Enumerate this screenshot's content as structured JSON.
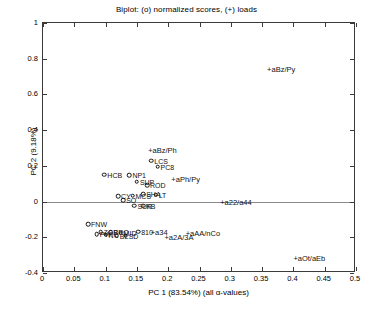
{
  "chart_data": {
    "type": "scatter",
    "title": "Biplot: (o) normalized scores, (+) loads",
    "xlabel": "PC 1 (83.54%) (all α-values)",
    "ylabel": "PC 2 (9.18%)",
    "xlim": [
      0,
      0.5
    ],
    "ylim": [
      -0.4,
      1
    ],
    "xticks": [
      "0",
      "0.05",
      "0.1",
      "0.15",
      "0.2",
      "0.25",
      "0.3",
      "0.35",
      "0.4",
      "0.45",
      "0.5"
    ],
    "xtick_values": [
      0,
      0.05,
      0.1,
      0.15,
      0.2,
      0.25,
      0.3,
      0.35,
      0.4,
      0.45,
      0.5
    ],
    "yticks": [
      "1",
      "0.8",
      "0.6",
      "0.4",
      "0.2",
      "0",
      "-0.2",
      "-0.4"
    ],
    "ytick_values": [
      1,
      0.8,
      0.6,
      0.4,
      0.2,
      0,
      -0.2,
      -0.4
    ],
    "grid": false,
    "legend": "none",
    "zero_line_y": 0,
    "series": [
      {
        "name": "normalized scores",
        "marker": "o",
        "points": [
          {
            "label": "HCB",
            "x": 0.098,
            "y": 0.15,
            "label_pos": "left"
          },
          {
            "label": "NP1",
            "x": 0.138,
            "y": 0.148,
            "label_pos": "right"
          },
          {
            "label": "LCS",
            "x": 0.173,
            "y": 0.228,
            "label_pos": "right"
          },
          {
            "label": "PC8",
            "x": 0.183,
            "y": 0.196,
            "label_pos": "right"
          },
          {
            "label": "SUP",
            "x": 0.15,
            "y": 0.112,
            "label_pos": "right"
          },
          {
            "label": "ROD",
            "x": 0.166,
            "y": 0.093,
            "label_pos": "right"
          },
          {
            "label": "CY",
            "x": 0.12,
            "y": 0.03,
            "label_pos": "right"
          },
          {
            "label": "MCS",
            "x": 0.143,
            "y": 0.034,
            "label_pos": "right"
          },
          {
            "label": "SHA",
            "x": 0.16,
            "y": 0.04,
            "label_pos": "right"
          },
          {
            "label": "LT",
            "x": 0.18,
            "y": 0.038,
            "label_pos": "right"
          },
          {
            "label": "SO",
            "x": 0.128,
            "y": 0.008,
            "label_pos": "right"
          },
          {
            "label": "KB",
            "x": 0.16,
            "y": -0.022,
            "label_pos": "right"
          },
          {
            "label": "SUR",
            "x": 0.146,
            "y": -0.022,
            "label_pos": "right"
          },
          {
            "label": "FNW",
            "x": 0.072,
            "y": -0.128,
            "label_pos": "right"
          },
          {
            "label": "ZGB",
            "x": 0.092,
            "y": -0.17,
            "label_pos": "right"
          },
          {
            "label": "PRO",
            "x": 0.108,
            "y": -0.172,
            "label_pos": "right"
          },
          {
            "label": "MID",
            "x": 0.124,
            "y": -0.174,
            "label_pos": "right"
          },
          {
            "label": "810",
            "x": 0.152,
            "y": -0.168,
            "label_pos": "right"
          },
          {
            "label": "SD",
            "x": 0.132,
            "y": -0.192,
            "label_pos": "right"
          },
          {
            "label": "BL",
            "x": 0.118,
            "y": -0.19,
            "label_pos": "right"
          },
          {
            "label": "NC",
            "x": 0.1,
            "y": -0.186,
            "label_pos": "right"
          },
          {
            "label": "PW",
            "x": 0.086,
            "y": -0.182,
            "label_pos": "right"
          }
        ]
      },
      {
        "name": "loads",
        "marker": "+",
        "points": [
          {
            "label": "+aBz/Py",
            "x": 0.358,
            "y": 0.74,
            "label_pos": "right"
          },
          {
            "label": "+aBz/Ph",
            "x": 0.168,
            "y": 0.288,
            "label_pos": "right"
          },
          {
            "label": "+aPh/Py",
            "x": 0.205,
            "y": 0.128,
            "label_pos": "right"
          },
          {
            "label": "+a22/a44",
            "x": 0.283,
            "y": 0.0,
            "label_pos": "right"
          },
          {
            "label": "+a34",
            "x": 0.172,
            "y": -0.168,
            "label_pos": "right"
          },
          {
            "label": "+a2A/3A",
            "x": 0.194,
            "y": -0.196,
            "label_pos": "right"
          },
          {
            "label": "+aAA/nCo",
            "x": 0.228,
            "y": -0.174,
            "label_pos": "right"
          },
          {
            "label": "+aOt/aEb",
            "x": 0.4,
            "y": -0.318,
            "label_pos": "right"
          }
        ]
      }
    ],
    "cluster_note": "Dense overlapping score markers near x 0.10-0.20"
  },
  "colors": {
    "axis": "#3a3a3a",
    "zero_line": "#8a8a8a",
    "marker": "#111111",
    "text": "#000000",
    "background": "#ffffff"
  }
}
